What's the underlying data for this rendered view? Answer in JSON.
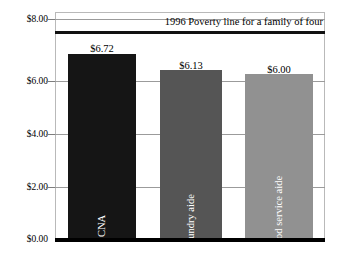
{
  "chart_data": {
    "type": "bar",
    "title": "",
    "subtitle": "",
    "xlabel": "",
    "ylabel": "",
    "categories": [
      "CNA",
      "Laundry aide",
      "Food service aide"
    ],
    "values": [
      6.72,
      6.13,
      6.0
    ],
    "value_labels": [
      "$6.72",
      "$6.13",
      "$6.00"
    ],
    "series": [
      {
        "name": "Average hourly wage",
        "values": [
          6.72,
          6.13,
          6.0
        ]
      }
    ],
    "ylim": [
      0,
      8
    ],
    "yticks": [
      0,
      2,
      4,
      6,
      8
    ],
    "ytick_labels": [
      "$0.00",
      "$2.00",
      "$4.00",
      "$6.00",
      "$8.00"
    ],
    "grid": true,
    "legend": "none",
    "annotations": [
      {
        "text": "1996 Poverty line for a family of four",
        "value": 8.0,
        "position": "top-right",
        "style": "thick-black-rule"
      }
    ],
    "bar_colors": [
      "#151515",
      "#555555",
      "#919191"
    ],
    "bar_label_colors": [
      "#ffffff",
      "#ffffff",
      "#ffffff"
    ]
  },
  "axis": {
    "y": {
      "ticks": [
        {
          "label": "$8.00",
          "value": 8
        },
        {
          "label": "$6.00",
          "value": 6
        },
        {
          "label": "$4.00",
          "value": 4
        },
        {
          "label": "$2.00",
          "value": 2
        },
        {
          "label": "$0.00",
          "value": 0
        }
      ]
    }
  },
  "annotation": {
    "poverty_line": "1996 Poverty line for a family of four"
  },
  "bars": [
    {
      "category": "CNA",
      "value_label": "$6.72"
    },
    {
      "category": "Laundry aide",
      "value_label": "$6.13"
    },
    {
      "category": "Food service aide",
      "value_label": "$6.00"
    }
  ]
}
